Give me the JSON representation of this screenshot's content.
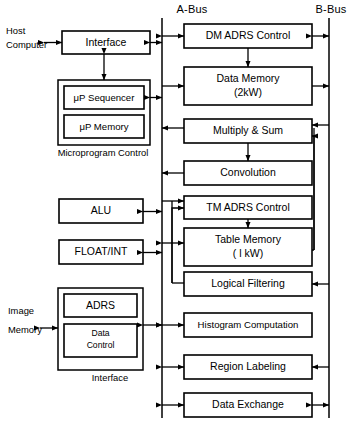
{
  "figure": {
    "type": "block-diagram",
    "bus_labels": {
      "a_bus": "A-Bus",
      "b_bus": "B-Bus"
    },
    "external_labels": {
      "host_line1": "Host",
      "host_line2": "Computer",
      "image_line1": "Image",
      "image_line2": "Memory"
    },
    "group_captions": {
      "microprogram_control": "Microprogram Control",
      "interface": "Interface"
    },
    "left_blocks": [
      {
        "id": "interface",
        "label": "Interface"
      },
      {
        "id": "up-sequencer",
        "label": "μP Sequencer"
      },
      {
        "id": "up-memory",
        "label": "μP Memory"
      },
      {
        "id": "alu",
        "label": "ALU"
      },
      {
        "id": "float-int",
        "label": "FLOAT/INT"
      },
      {
        "id": "adrs",
        "label": "ADRS"
      },
      {
        "id": "data-control",
        "label_line1": "Data",
        "label_line2": "Control"
      }
    ],
    "right_blocks": [
      {
        "id": "dm-adrs-control",
        "label": "DM  ADRS Control"
      },
      {
        "id": "data-memory",
        "label_line1": "Data  Memory",
        "label_line2": "(2kW)"
      },
      {
        "id": "multiply-sum",
        "label": "Multiply & Sum"
      },
      {
        "id": "convolution",
        "label": "Convolution"
      },
      {
        "id": "tm-adrs-control",
        "label": "TM ADRS Control"
      },
      {
        "id": "table-memory",
        "label_line1": "Table  Memory",
        "label_line2": "( l kW)"
      },
      {
        "id": "logical-filtering",
        "label": "Logical  Filtering"
      },
      {
        "id": "histogram-computation",
        "label": "Histogram  Computation"
      },
      {
        "id": "region-labeling",
        "label": "Region  Labeling"
      },
      {
        "id": "data-exchange",
        "label": "Data  Exchange"
      }
    ],
    "colors": {
      "background": "#ffffff",
      "ink": "#000000"
    }
  }
}
